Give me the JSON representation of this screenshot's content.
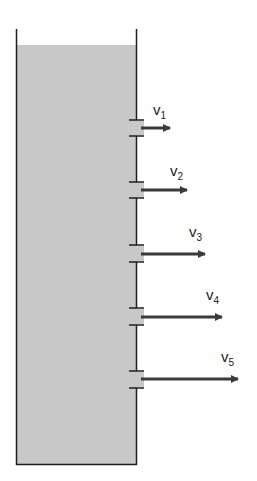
{
  "diagram": {
    "colors": {
      "water": "#c8c8c8",
      "wall": "#1e1e1e",
      "arrow": "#3a3a3a",
      "background": "#ffffff"
    },
    "outlets": [
      {
        "label": "v",
        "subscript": "1",
        "y": 128,
        "arrow_end": 170
      },
      {
        "label": "v",
        "subscript": "2",
        "y": 190,
        "arrow_end": 187
      },
      {
        "label": "v",
        "subscript": "3",
        "y": 254,
        "arrow_end": 205
      },
      {
        "label": "v",
        "subscript": "4",
        "y": 317,
        "arrow_end": 222
      },
      {
        "label": "v",
        "subscript": "5",
        "y": 379,
        "arrow_end": 238
      }
    ]
  }
}
